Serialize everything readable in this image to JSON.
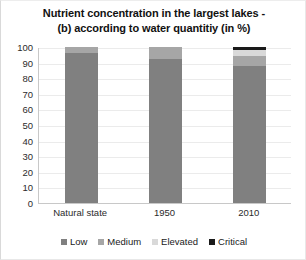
{
  "chart_data": {
    "type": "bar",
    "subtype": "stacked-column-100",
    "title": "Nutrient concentration in the largest lakes - (b) according to water quantitiy (in %)",
    "title_lines": [
      "Nutrient concentration in the largest lakes -",
      "(b) according to water quantitiy (in %)"
    ],
    "xlabel": "",
    "ylabel": "",
    "ylim": [
      0,
      100
    ],
    "yticks": [
      0,
      10,
      20,
      30,
      40,
      50,
      60,
      70,
      80,
      90,
      100
    ],
    "ytick_labels": [
      "100",
      "90",
      "80",
      "70",
      "60",
      "50",
      "40",
      "30",
      "20",
      "10",
      "0"
    ],
    "grid": true,
    "legend_position": "bottom",
    "categories": [
      "Natural state",
      "1950",
      "2010"
    ],
    "series": [
      {
        "name": "Low",
        "color": "#808080",
        "values": [
          96,
          92,
          88
        ]
      },
      {
        "name": "Medium",
        "color": "#a6a6a6",
        "values": [
          4,
          8,
          6
        ]
      },
      {
        "name": "Elevated",
        "color": "#d9d9d9",
        "values": [
          0,
          0,
          4
        ]
      },
      {
        "name": "Critical",
        "color": "#1a1a1a",
        "values": [
          0,
          0,
          2
        ]
      }
    ]
  },
  "legend": {
    "items": [
      {
        "label": "Low"
      },
      {
        "label": "Medium"
      },
      {
        "label": "Elevated"
      },
      {
        "label": "Critical"
      }
    ]
  }
}
